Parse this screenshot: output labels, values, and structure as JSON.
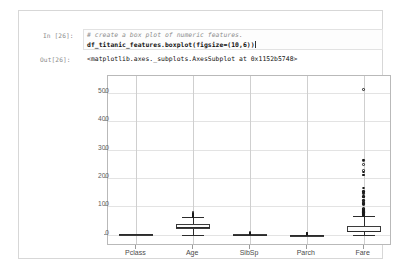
{
  "notebook": {
    "input_prompt": "In [26]:",
    "output_prompt": "Out[26]:",
    "code_comment": "# create a box plot of numeric features.",
    "code_statement": "df_titanic_features.boxplot(figsize=(10,6))",
    "output_text": "<matplotlib.axes._subplots.AxesSubplot at 0x1152b5748>"
  },
  "colors": {
    "cell_border": "#d7d7d7",
    "prompt_text": "#8a8a8a",
    "comment_text": "#8c8c8c",
    "code_text": "#111111",
    "grid": "#e3e3e3",
    "axis": "#b9b9b9",
    "marker": "#1a1a1a"
  },
  "chart_data": {
    "type": "box",
    "title": "",
    "xlabel": "",
    "ylabel": "",
    "grid": true,
    "legend": "none",
    "ylim": [
      -40,
      560
    ],
    "yticks": [
      0,
      100,
      200,
      300,
      400,
      500
    ],
    "ytick_labels": [
      "0",
      "100",
      "200",
      "300",
      "400",
      "500"
    ],
    "categories": [
      "Pclass",
      "Age",
      "SibSp",
      "Parch",
      "Fare"
    ],
    "boxes": [
      {
        "name": "Pclass",
        "whisker_low": 1,
        "q1": 2,
        "median": 3,
        "q3": 3,
        "whisker_high": 3,
        "fliers": []
      },
      {
        "name": "Age",
        "whisker_low": 0.42,
        "q1": 20.1,
        "median": 28.0,
        "q3": 38.0,
        "whisker_high": 64.0,
        "fliers": [
          65,
          65,
          66,
          70,
          70.5,
          71,
          71,
          74,
          80
        ]
      },
      {
        "name": "SibSp",
        "whisker_low": 0,
        "q1": 0,
        "median": 0,
        "q3": 1,
        "whisker_high": 2,
        "fliers": [
          3,
          4,
          5,
          8
        ]
      },
      {
        "name": "Parch",
        "whisker_low": 0,
        "q1": 0,
        "median": 0,
        "q3": 0,
        "whisker_high": 0,
        "fliers": [
          1,
          2,
          3,
          4,
          5,
          6
        ]
      },
      {
        "name": "Fare",
        "whisker_low": 0,
        "q1": 7.91,
        "median": 14.45,
        "q3": 31.0,
        "whisker_high": 65.0,
        "fliers": [
          66,
          69,
          69,
          71,
          73,
          75,
          76,
          77,
          78,
          79,
          79,
          80,
          81,
          82,
          83,
          83,
          83,
          86,
          89,
          90,
          91,
          93,
          106,
          108,
          110,
          113,
          120,
          120,
          133,
          134,
          135,
          146,
          151,
          153,
          153,
          164,
          211,
          211,
          221,
          227,
          247,
          262,
          263,
          512
        ]
      }
    ]
  }
}
